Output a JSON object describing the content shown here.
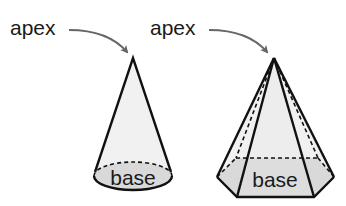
{
  "diagram": {
    "colors": {
      "outline": "#111111",
      "arrow": "#666666",
      "face_fill": "#f1f1f1",
      "base_fill": "#d6d6d6",
      "background": "#ffffff"
    },
    "cone": {
      "apex_label": "apex",
      "base_label": "base"
    },
    "pyramid": {
      "apex_label": "apex",
      "base_label": "base"
    }
  }
}
